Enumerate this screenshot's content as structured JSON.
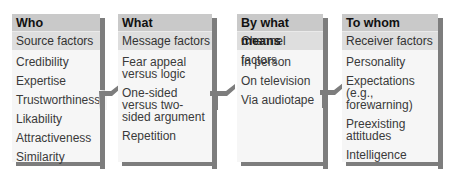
{
  "diagram": {
    "columns": [
      {
        "header": "Who",
        "subheader": "Source factors",
        "items": [
          "Credibility",
          "Expertise",
          "Trustworthiness",
          "Likability",
          "Attractiveness",
          "Similarity"
        ]
      },
      {
        "header": "What",
        "subheader": "Message factors",
        "items": [
          "Fear appeal versus logic",
          "One-sided versus two-sided argument",
          "Repetition"
        ]
      },
      {
        "header": "By what means",
        "subheader": "Channel factors",
        "items": [
          "In person",
          "On television",
          "Via audiotape"
        ]
      },
      {
        "header": "To whom",
        "subheader": "Receiver factors",
        "items": [
          "Personality",
          "Expectations (e.g., forewarning)",
          "Preexisting attitudes",
          "Intelligence"
        ]
      }
    ],
    "colors": {
      "header_bg": "#c9c9c9",
      "subheader_bg": "#dedede",
      "card_bg": "#f6f6f6",
      "shadow": "#7d7d7d"
    }
  }
}
